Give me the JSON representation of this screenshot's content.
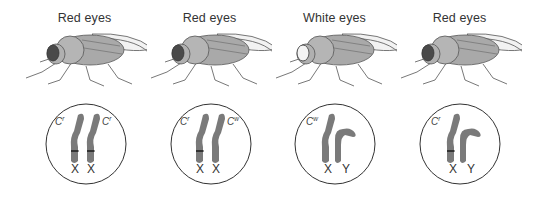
{
  "figure": {
    "panels": [
      {
        "phenotype": "Red eyes",
        "eye_color": "red",
        "chromosomes": [
          {
            "type": "X",
            "allele_base": "C",
            "allele_sup": "r",
            "band": true
          },
          {
            "type": "X",
            "allele_base": "C",
            "allele_sup": "r",
            "band": true
          }
        ]
      },
      {
        "phenotype": "Red eyes",
        "eye_color": "red",
        "chromosomes": [
          {
            "type": "X",
            "allele_base": "C",
            "allele_sup": "r",
            "band": true
          },
          {
            "type": "X",
            "allele_base": "C",
            "allele_sup": "w",
            "band": false
          }
        ]
      },
      {
        "phenotype": "White eyes",
        "eye_color": "white",
        "chromosomes": [
          {
            "type": "X",
            "allele_base": "C",
            "allele_sup": "w",
            "band": false
          },
          {
            "type": "Y",
            "allele_base": "",
            "allele_sup": "",
            "band": false
          }
        ]
      },
      {
        "phenotype": "Red eyes",
        "eye_color": "red",
        "chromosomes": [
          {
            "type": "X",
            "allele_base": "C",
            "allele_sup": "r",
            "band": true
          },
          {
            "type": "Y",
            "allele_base": "",
            "allele_sup": "",
            "band": false
          }
        ]
      }
    ],
    "colors": {
      "body": "#a9a9a9",
      "outline": "#555555",
      "red_eye": "#4a4a4a",
      "white_eye": "#f4f4f4",
      "chromosome": "#7a7a7a",
      "circle": "#333333"
    }
  }
}
